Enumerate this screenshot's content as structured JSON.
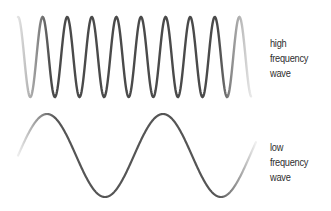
{
  "diagram": {
    "waves": [
      {
        "id": "high",
        "label_lines": [
          "high",
          "frequency",
          "wave"
        ],
        "description": "high frequency wave",
        "color": "#4a4a4a",
        "x_start": 18,
        "x_end": 251,
        "center_y": 57,
        "amplitude": 40,
        "period": 24.6,
        "phase_start": "peak"
      },
      {
        "id": "low",
        "label_lines": [
          "low",
          "frequency",
          "wave"
        ],
        "description": "low frequency wave",
        "color": "#555555",
        "x_start": 18,
        "x_end": 256,
        "center_y": 155.5,
        "amplitude": 41.5,
        "period": 116,
        "phase_start": "rising_mid"
      }
    ]
  }
}
